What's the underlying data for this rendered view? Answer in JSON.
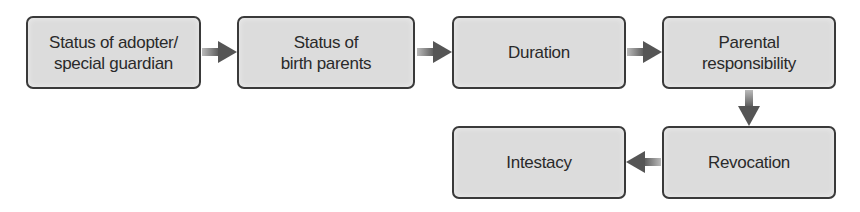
{
  "diagram": {
    "type": "flowchart",
    "nodes": [
      {
        "id": "adopter",
        "label": "Status of adopter/\nspecial guardian"
      },
      {
        "id": "birth_parents",
        "label": "Status of\nbirth parents"
      },
      {
        "id": "duration",
        "label": "Duration"
      },
      {
        "id": "parental_responsibility",
        "label": "Parental\nresponsibility"
      },
      {
        "id": "revocation",
        "label": "Revocation"
      },
      {
        "id": "intestacy",
        "label": "Intestacy"
      }
    ],
    "edges": [
      {
        "from": "adopter",
        "to": "birth_parents",
        "direction": "right"
      },
      {
        "from": "birth_parents",
        "to": "duration",
        "direction": "right"
      },
      {
        "from": "duration",
        "to": "parental_responsibility",
        "direction": "right"
      },
      {
        "from": "parental_responsibility",
        "to": "revocation",
        "direction": "down"
      },
      {
        "from": "revocation",
        "to": "intestacy",
        "direction": "left"
      }
    ],
    "colors": {
      "box_fill": "#dcdcdc",
      "box_border": "#3a3a3a",
      "arrow": "#555555",
      "text": "#2a2a2a"
    }
  }
}
